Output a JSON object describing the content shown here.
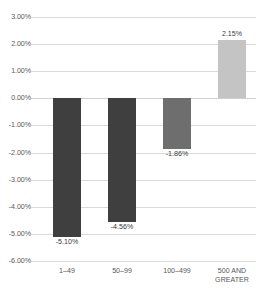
{
  "chart_data": {
    "type": "bar",
    "title": "",
    "xlabel": "",
    "ylabel": "",
    "categories": [
      "1–49",
      "50–99",
      "100–499",
      "500 AND\nGREATER"
    ],
    "values": [
      -5.1,
      -4.56,
      -1.86,
      2.15
    ],
    "value_labels": [
      "-5.10%",
      "-4.56%",
      "-1.86%",
      "2.15%"
    ],
    "bar_colors": [
      "#3f3f3f",
      "#3f3f3f",
      "#6e6e6e",
      "#c4c4c4"
    ],
    "ylim": [
      -6.0,
      3.0
    ],
    "ytick_values": [
      3.0,
      2.0,
      1.0,
      0.0,
      -1.0,
      -2.0,
      -3.0,
      -4.0,
      -5.0,
      -6.0
    ],
    "ytick_labels": [
      "3.00%",
      "2.00%",
      "1.00%",
      "0.00%",
      "-1.00%",
      "-2.00%",
      "-3.00%",
      "-4.00%",
      "-5.00%",
      "-6.00%"
    ],
    "grid": true,
    "grid_color": "#d9d9d9",
    "legend": "none",
    "units": "percent"
  }
}
